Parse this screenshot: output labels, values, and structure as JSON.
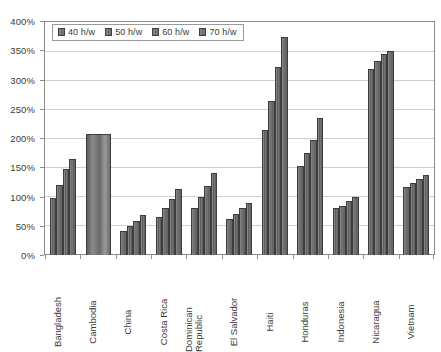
{
  "chart_data": {
    "type": "bar",
    "title": "",
    "xlabel": "",
    "ylabel": "",
    "ylim": [
      0,
      400
    ],
    "ytick_step": 50,
    "ytick_labels": [
      "0%",
      "50%",
      "100%",
      "150%",
      "200%",
      "250%",
      "300%",
      "350%",
      "400%"
    ],
    "ytick_values": [
      0,
      50,
      100,
      150,
      200,
      250,
      300,
      350,
      400
    ],
    "grid": true,
    "legend_position": "top-left-inside",
    "categories": [
      "Bangladesh",
      "Cambodia",
      "China",
      "Costa Rica",
      "Dominican Republic",
      "El Salvador",
      "Haiti",
      "Honduras",
      "Indonesia",
      "Nicaragua",
      "Vietnam"
    ],
    "series": [
      {
        "name": "40 h/w",
        "values": [
          98,
          207,
          42,
          66,
          80,
          62,
          215,
          152,
          80,
          320,
          117
        ]
      },
      {
        "name": "50 h/w",
        "values": [
          120,
          null,
          50,
          80,
          100,
          70,
          265,
          175,
          85,
          333,
          124
        ]
      },
      {
        "name": "60 h/w",
        "values": [
          148,
          null,
          58,
          97,
          118,
          80,
          323,
          197,
          92,
          345,
          131
        ]
      },
      {
        "name": "70 h/w",
        "values": [
          165,
          null,
          68,
          113,
          140,
          90,
          375,
          235,
          100,
          350,
          138
        ]
      }
    ],
    "legend_entries": [
      "40 h/w",
      "50 h/w",
      "60 h/w",
      "70 h/w"
    ]
  },
  "colors": {
    "bar_fill_light": "#9a9a9a",
    "bar_fill_dark": "#5a5a5a",
    "bar_border": "#3d3d3d",
    "gridline": "#cfcfcf",
    "axis": "#8c8c8c",
    "text": "#3a3a3a",
    "background": "#ffffff"
  }
}
